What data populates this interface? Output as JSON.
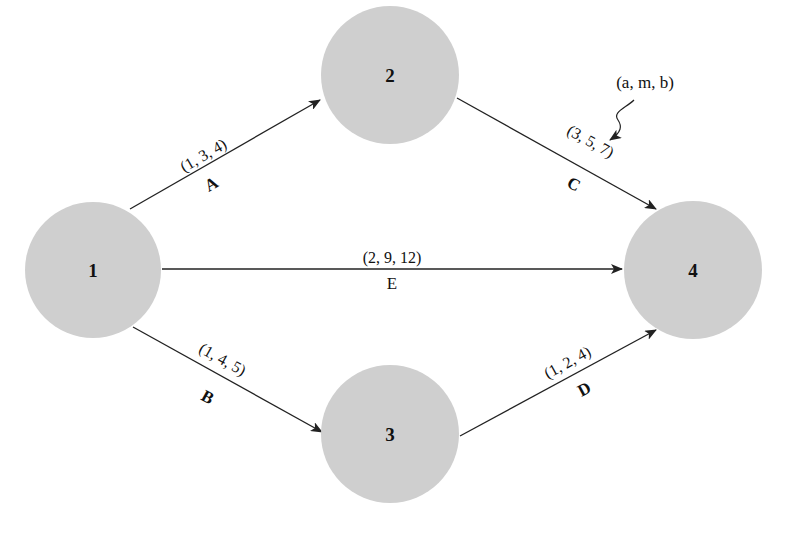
{
  "diagram": {
    "type": "activity-on-arrow network (PERT)",
    "node_color": "#cfcfcf",
    "line_color": "#222222",
    "nodes": [
      {
        "id": "1",
        "label": "1",
        "cx": 93,
        "cy": 270,
        "r": 68
      },
      {
        "id": "2",
        "label": "2",
        "cx": 390,
        "cy": 75,
        "r": 69
      },
      {
        "id": "3",
        "label": "3",
        "cx": 390,
        "cy": 434,
        "r": 69
      },
      {
        "id": "4",
        "label": "4",
        "cx": 693,
        "cy": 270,
        "r": 69
      }
    ],
    "edges": [
      {
        "name": "A",
        "from": "1",
        "to": "2",
        "params": "(1, 3, 4)"
      },
      {
        "name": "B",
        "from": "1",
        "to": "3",
        "params": "(1, 4, 5)"
      },
      {
        "name": "C",
        "from": "2",
        "to": "4",
        "params": "(3, 5, 7)"
      },
      {
        "name": "D",
        "from": "3",
        "to": "4",
        "params": "(1, 2, 4)"
      },
      {
        "name": "E",
        "from": "1",
        "to": "4",
        "params": "(2, 9, 12)"
      }
    ],
    "annotation": {
      "text": "(a, m, b)",
      "points_to": "C"
    }
  }
}
